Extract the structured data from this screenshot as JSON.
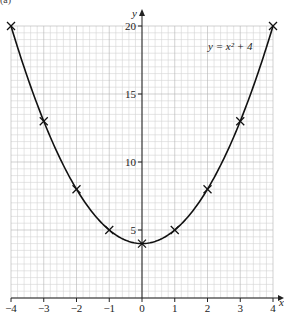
{
  "question_part": "(a)",
  "chart_data": {
    "type": "line",
    "title": "",
    "equation_label": "y = x² + 4",
    "xlabel": "x",
    "ylabel": "y",
    "xlim": [
      -4,
      4
    ],
    "ylim": [
      0,
      20
    ],
    "grid": true,
    "x_ticks": [
      -4,
      -3,
      -2,
      -1,
      0,
      1,
      2,
      3,
      4
    ],
    "x_tick_labels": [
      "−4",
      "−3",
      "−2",
      "−1",
      "0",
      "1",
      "2",
      "3",
      "4"
    ],
    "y_ticks": [
      5,
      10,
      15,
      20
    ],
    "y_tick_labels": [
      "5",
      "10",
      "15",
      "20"
    ],
    "series": [
      {
        "name": "y = x² + 4",
        "x": [
          -4,
          -3,
          -2,
          -1,
          0,
          1,
          2,
          3,
          4
        ],
        "y": [
          20,
          13,
          8,
          5,
          4,
          5,
          8,
          13,
          20
        ],
        "marker": "x",
        "curve": "smooth"
      }
    ]
  },
  "colors": {
    "grid_minor": "#d4d4d4",
    "grid_major": "#b4b4b4",
    "axis": "#222222",
    "curve": "#111111"
  }
}
